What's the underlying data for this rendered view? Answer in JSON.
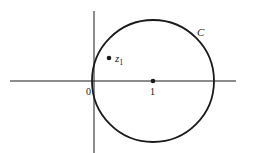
{
  "diagram": {
    "title": "",
    "colors": {
      "ink": "#1a1a1a",
      "background": "#ffffff"
    },
    "axes": {
      "horizontal": {
        "x1": 10,
        "x2": 236,
        "y": 81
      },
      "vertical": {
        "x": 94,
        "y1": 11,
        "y2": 153
      }
    },
    "circle": {
      "cx": 153,
      "cy": 81,
      "r": 61,
      "label": "C"
    },
    "points": [
      {
        "name": "center",
        "x": 153,
        "y": 81,
        "label": "1"
      },
      {
        "name": "z1",
        "x": 109,
        "y": 58,
        "label": "z",
        "subscript": "1"
      }
    ],
    "labels": {
      "origin": "0",
      "center": "1",
      "curve": "C",
      "z_main": "z",
      "z_sub": "1"
    }
  }
}
